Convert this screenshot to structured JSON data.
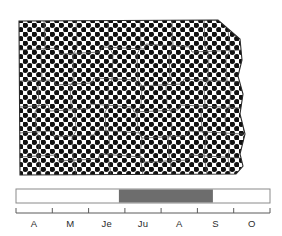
{
  "figure": {
    "kind": "species-distribution-and-phenology-figure",
    "background_color": "#ffffff",
    "ink_color": "#1a1a1a"
  },
  "map": {
    "region_name": "North Dakota",
    "fill_style": "dotted-stipple",
    "fill_description": "dense black dot stipple covering the entire state outline",
    "dot_color": "#111111",
    "dot_background_color": "#fefefe",
    "outline_color": "#2a2a2a",
    "county_lines_color": "#4a4a4a",
    "coverage": "entire state",
    "dot_spacing_px": 9,
    "dot_radius_px": 2.7
  },
  "timeline": {
    "axis_color": "#5a5a5a",
    "bar_outline_color": "#777777",
    "bar_inactive_color": "#ffffff",
    "bar_active_color": "#6d6d6d",
    "active_start_label": "Je",
    "active_end_label": "S",
    "active_start_fraction": 0.405,
    "active_end_fraction": 0.775,
    "ticks": [
      0,
      1,
      2,
      3,
      4,
      5,
      6,
      7
    ],
    "months": [
      {
        "label": "A",
        "name": "Avril"
      },
      {
        "label": "M",
        "name": "Mai"
      },
      {
        "label": "Je",
        "name": "Juin"
      },
      {
        "label": "Ju",
        "name": "Juillet"
      },
      {
        "label": "A",
        "name": "Aout"
      },
      {
        "label": "S",
        "name": "Septembre"
      },
      {
        "label": "O",
        "name": "Octobre"
      }
    ]
  }
}
